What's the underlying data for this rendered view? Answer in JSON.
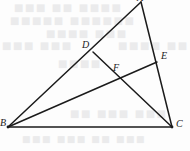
{
  "figure": {
    "width": 190,
    "height": 151,
    "background_color": "#fdfdfd",
    "stroke_color": "#1b1b1b",
    "label_color": "#1b1b1b",
    "ghost_text_color": "#e9e9ea"
  },
  "points": {
    "A": {
      "label": "A",
      "x": 141,
      "y": 2,
      "label_x": 137,
      "label_y": -7,
      "on": "apex-cut-off-top-edge"
    },
    "B": {
      "label": "B",
      "x": 8,
      "y": 127,
      "label_x": 0,
      "label_y": 118,
      "on": "bottom-left-vertex"
    },
    "C": {
      "label": "C",
      "x": 172,
      "y": 127,
      "label_x": 176,
      "label_y": 119,
      "on": "bottom-right-vertex"
    },
    "D": {
      "label": "D",
      "x": 93,
      "y": 52,
      "label_x": 82,
      "label_y": 40,
      "on": "segment-AB"
    },
    "E": {
      "label": "E",
      "x": 157,
      "y": 62,
      "label_x": 161,
      "label_y": 51,
      "on": "segment-AC"
    },
    "F": {
      "label": "F",
      "x": 119,
      "y": 76,
      "label_x": 113,
      "label_y": 63,
      "on": "intersection-of-DC-and-BE"
    }
  },
  "segments": [
    {
      "name": "side-AB",
      "from": "A",
      "to": "B",
      "x1": 141,
      "y1": 2,
      "x2": 8,
      "y2": 127,
      "width": 1.5
    },
    {
      "name": "side-AC",
      "from": "A",
      "to": "C",
      "x1": 141,
      "y1": 2,
      "x2": 172,
      "y2": 127,
      "width": 1.5
    },
    {
      "name": "side-BC",
      "from": "B",
      "to": "C",
      "x1": 8,
      "y1": 127,
      "x2": 172,
      "y2": 127,
      "width": 1.5
    },
    {
      "name": "cevian-DC",
      "from": "D",
      "to": "C",
      "x1": 93,
      "y1": 52,
      "x2": 172,
      "y2": 127,
      "width": 1.5
    },
    {
      "name": "cevian-BE",
      "from": "B",
      "to": "E",
      "x1": 8,
      "y1": 127,
      "x2": 157,
      "y2": 62,
      "width": 1.5
    }
  ],
  "ghost_text": {
    "note": "Faint illegible bleed-through text from the reverse side of the page",
    "lines": [
      {
        "text": "■■■ ■■ ■■■■",
        "x": 14,
        "y": 2,
        "size": 10
      },
      {
        "text": "■■■■■ ■■■■■■",
        "x": 10,
        "y": 15,
        "size": 10
      },
      {
        "text": "■■■■ ■■■",
        "x": 46,
        "y": 28,
        "size": 10
      },
      {
        "text": "■■■ ■■■",
        "x": 2,
        "y": 40,
        "size": 10
      },
      {
        "text": "■■■■ ■■",
        "x": 118,
        "y": 40,
        "size": 10
      },
      {
        "text": "■■■■",
        "x": 58,
        "y": 58,
        "size": 10
      },
      {
        "text": "■■ ■■■ ■■■",
        "x": 70,
        "y": 108,
        "size": 10
      },
      {
        "text": "■■■ ■■■ ■■ ■■■",
        "x": 22,
        "y": 134,
        "size": 9
      }
    ]
  }
}
